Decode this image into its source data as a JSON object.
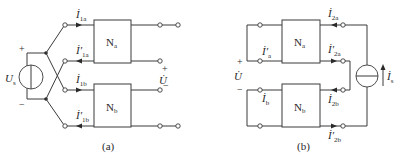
{
  "figure": {
    "panel_a": {
      "caption": "(a)",
      "source": {
        "symbol": "U",
        "subscript": "s",
        "plus": "+",
        "minus": "−"
      },
      "network_a": {
        "name": "N",
        "subscript": "a"
      },
      "network_b": {
        "name": "N",
        "subscript": "b"
      },
      "currents": [
        {
          "symbol": "İ",
          "subscript": "1a",
          "prime": ""
        },
        {
          "symbol": "İ",
          "subscript": "1a",
          "prime": "′"
        },
        {
          "symbol": "İ",
          "subscript": "1b",
          "prime": ""
        },
        {
          "symbol": "İ",
          "subscript": "1b",
          "prime": "′"
        }
      ],
      "output_voltage": {
        "symbol": "U̇",
        "plus": "+",
        "minus": "−"
      }
    },
    "panel_b": {
      "caption": "(b)",
      "network_a": {
        "name": "N",
        "subscript": "a"
      },
      "network_b": {
        "name": "N",
        "subscript": "b"
      },
      "left_currents": [
        {
          "symbol": "İ",
          "subscript": "a",
          "prime": "′"
        },
        {
          "symbol": "İ",
          "subscript": "b",
          "prime": ""
        }
      ],
      "right_currents": [
        {
          "symbol": "İ",
          "subscript": "2a",
          "prime": ""
        },
        {
          "symbol": "İ",
          "subscript": "2a",
          "prime": "′"
        },
        {
          "symbol": "İ",
          "subscript": "2b",
          "prime": ""
        },
        {
          "symbol": "İ",
          "subscript": "2b",
          "prime": "′"
        }
      ],
      "voltage": {
        "symbol": "U̇",
        "plus": "+",
        "minus": "−"
      },
      "current_source": {
        "symbol": "İ",
        "subscript": "s"
      }
    }
  }
}
